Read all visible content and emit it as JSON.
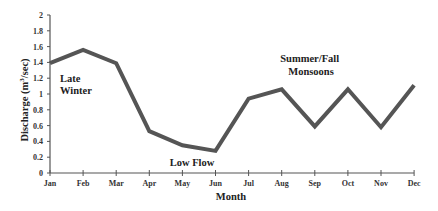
{
  "chart_data": {
    "type": "line",
    "title": "",
    "xlabel": "Month",
    "ylabel": "Discharge (m³/sec)",
    "ylabel_parts": {
      "prefix": "Discharge (m",
      "sup": "3",
      "suffix": "/sec)"
    },
    "ylim": [
      0,
      2
    ],
    "yticks": [
      "0",
      "0.2",
      "0.4",
      "0.6",
      "0.8",
      "1",
      "1.2",
      "1.4",
      "1.6",
      "1.8",
      "2"
    ],
    "ytick_values": [
      0,
      0.2,
      0.4,
      0.6,
      0.8,
      1.0,
      1.2,
      1.4,
      1.6,
      1.8,
      2.0
    ],
    "categories": [
      "Jan",
      "Feb",
      "Mar",
      "Apr",
      "May",
      "Jun",
      "Jul",
      "Aug",
      "Sep",
      "Oct",
      "Nov",
      "Dec"
    ],
    "series": [
      {
        "name": "Discharge",
        "values": [
          1.39,
          1.56,
          1.39,
          0.53,
          0.35,
          0.28,
          0.94,
          1.06,
          0.59,
          1.06,
          0.58,
          1.11
        ],
        "color": "#555555"
      }
    ],
    "grid": false,
    "legend": null,
    "annotations": [
      {
        "lines": [
          "Late",
          "Winter"
        ],
        "near": "Jan-Feb"
      },
      {
        "lines": [
          "Low Flow"
        ],
        "near": "May-Jun"
      },
      {
        "lines": [
          "Summer/Fall",
          "Monsoons"
        ],
        "near": "Aug-Sep"
      }
    ]
  },
  "colors": {
    "line": "#555555",
    "axis": "#555555",
    "text": "#222222"
  }
}
